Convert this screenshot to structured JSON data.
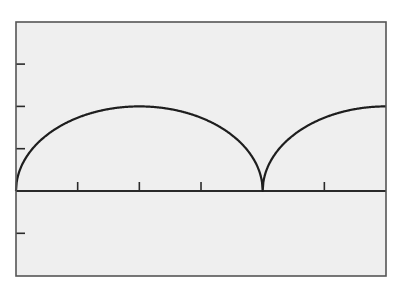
{
  "chart_data": {
    "type": "line",
    "title": "",
    "xlabel": "",
    "ylabel": "",
    "xlim": [
      0,
      6
    ],
    "ylim": [
      -2,
      4
    ],
    "x_ticks": [
      1,
      2,
      3,
      4,
      5
    ],
    "y_ticks": [
      -1,
      1,
      2,
      3
    ],
    "x_tick_labels": [],
    "y_tick_labels": [],
    "grid": false,
    "legend": null,
    "series": [
      {
        "name": "semi-elliptical arches",
        "description": "Periodic arches of height 2 and width 4: y = 2*sqrt(1 - ((x mod 4 - 2)/2)^2)",
        "x": [
          0,
          0.25,
          0.5,
          1,
          1.5,
          2,
          2.5,
          3,
          3.5,
          3.75,
          4,
          4.25,
          4.5,
          5,
          5.5,
          6
        ],
        "y": [
          0,
          0.97,
          1.32,
          1.73,
          1.94,
          2,
          1.94,
          1.73,
          1.32,
          0.97,
          0,
          0.97,
          1.32,
          1.73,
          1.94,
          2
        ]
      }
    ],
    "colors": {
      "background": "#efefef",
      "frame": "#555555",
      "axis": "#2a2a2a",
      "curve": "#1e1e1e"
    }
  },
  "layout": {
    "plot_left": 16,
    "plot_top": 22,
    "plot_right": 386,
    "plot_bottom": 276,
    "x_axis_y": 191,
    "x_unit_px": 61.67,
    "y_unit_px": 42.3,
    "tick_length": 9
  }
}
